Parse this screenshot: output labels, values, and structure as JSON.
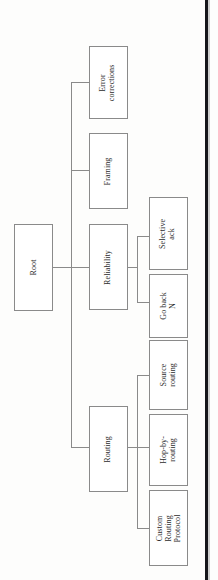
{
  "diagram": {
    "type": "tree",
    "title": "Root",
    "orientation": "rotated-90-ccw",
    "nodes": {
      "root": {
        "label": "Root",
        "level": 0
      },
      "error": {
        "label": "Error\ncorrections",
        "level": 1
      },
      "framing": {
        "label": "Framing",
        "level": 1
      },
      "reliability": {
        "label": "Reliability",
        "level": 1
      },
      "routing": {
        "label": "Routing",
        "level": 1
      },
      "selack": {
        "label": "Selective\nack",
        "level": 2
      },
      "gobackn": {
        "label": "Go back\nN",
        "level": 2
      },
      "srcrouting": {
        "label": "Source\nrouting",
        "level": 2
      },
      "hopbyhop": {
        "label": "Hop-by-\nrouting",
        "level": 2
      },
      "customrp": {
        "label": "Custom\nRouting\nProtocol",
        "level": 2
      }
    },
    "edges": [
      {
        "from": "root",
        "to": "error"
      },
      {
        "from": "root",
        "to": "framing"
      },
      {
        "from": "root",
        "to": "reliability"
      },
      {
        "from": "root",
        "to": "routing"
      },
      {
        "from": "reliability",
        "to": "selack"
      },
      {
        "from": "reliability",
        "to": "gobackn"
      },
      {
        "from": "routing",
        "to": "srcrouting"
      },
      {
        "from": "routing",
        "to": "hopbyhop"
      },
      {
        "from": "routing",
        "to": "customrp"
      }
    ],
    "colors": {
      "box_border": "#8a8a8a",
      "box_fill": "#ffffff",
      "connector": "#8a8a8a",
      "page_edge": "#15161a",
      "text": "#2b2b2b",
      "background": "#fdfdfc"
    }
  }
}
